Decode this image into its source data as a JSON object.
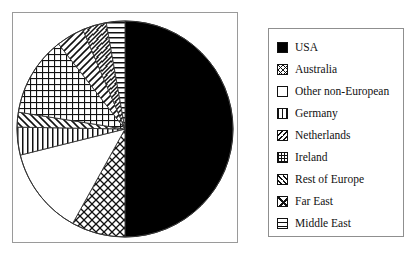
{
  "chart_data": {
    "type": "pie",
    "title": "",
    "legend_position": "right",
    "categories": [
      "USA",
      "Australia",
      "Other non-European",
      "Germany",
      "Netherlands",
      "Ireland",
      "Rest of Europe",
      "Far East",
      "Middle East"
    ],
    "values": [
      50,
      8,
      13,
      4,
      2,
      12,
      4,
      4,
      3
    ],
    "start_angle_deg": 0,
    "direction": "clockwise",
    "slices": [
      {
        "label": "USA",
        "value": 50,
        "pattern": "solid-black",
        "start_deg": 0,
        "end_deg": 180
      },
      {
        "label": "Australia",
        "value": 8,
        "pattern": "diagonal-crosshatch",
        "start_deg": 180,
        "end_deg": 209
      },
      {
        "label": "Other non-European",
        "value": 13,
        "pattern": "white",
        "start_deg": 209,
        "end_deg": 256
      },
      {
        "label": "Germany",
        "value": 4,
        "pattern": "vertical-lines",
        "start_deg": 256,
        "end_deg": 271
      },
      {
        "label": "Netherlands",
        "value": 2,
        "pattern": "diagonal-stripes",
        "start_deg": 271,
        "end_deg": 279
      },
      {
        "label": "Ireland",
        "value": 12,
        "pattern": "fine-grid",
        "start_deg": 279,
        "end_deg": 322
      },
      {
        "label": "Rest of Europe",
        "value": 4,
        "pattern": "diagonal-stripes-2",
        "start_deg": 322,
        "end_deg": 337
      },
      {
        "label": "Far East",
        "value": 4,
        "pattern": "crosshatch",
        "start_deg": 337,
        "end_deg": 350
      },
      {
        "label": "Middle East",
        "value": 3,
        "pattern": "horizontal-lines",
        "start_deg": 350,
        "end_deg": 360
      }
    ]
  },
  "legend": {
    "items": [
      {
        "label": "USA",
        "swatch": "solid-black-swatch"
      },
      {
        "label": "Australia",
        "swatch": "diagonal-crosshatch-swatch"
      },
      {
        "label": "Other non-European",
        "swatch": "white-swatch"
      },
      {
        "label": "Germany",
        "swatch": "vertical-lines-swatch"
      },
      {
        "label": "Netherlands",
        "swatch": "diagonal-stripes-swatch"
      },
      {
        "label": "Ireland",
        "swatch": "fine-grid-swatch"
      },
      {
        "label": "Rest of Europe",
        "swatch": "diagonal-stripes-2-swatch"
      },
      {
        "label": "Far East",
        "swatch": "crosshatch-swatch"
      },
      {
        "label": "Middle East",
        "swatch": "horizontal-lines-swatch"
      }
    ]
  },
  "colors": {
    "ink": "#111111",
    "border": "#9a9a9a",
    "background": "#ffffff"
  }
}
